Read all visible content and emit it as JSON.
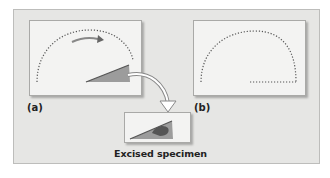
{
  "figure": {
    "panel_a": {
      "label": "(a)"
    },
    "panel_b": {
      "label": "(b)"
    },
    "specimen": {
      "caption": "Excised specimen"
    }
  },
  "colors": {
    "background": "#e6e6e4",
    "panel": "#f3f3f2",
    "dots": "#555555",
    "wedge": "#8c8c8c",
    "wedge_dark": "#555555",
    "arrow": "#9a9a9a"
  }
}
